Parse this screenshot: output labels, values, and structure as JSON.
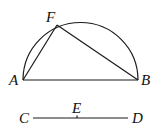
{
  "diagram": {
    "points": {
      "A": {
        "label": "A",
        "x": 23,
        "y": 80
      },
      "B": {
        "label": "B",
        "x": 138,
        "y": 80
      },
      "F": {
        "label": "F",
        "x": 57,
        "y": 25
      },
      "C": {
        "label": "C",
        "x": 33,
        "y": 118
      },
      "D": {
        "label": "D",
        "x": 128,
        "y": 118
      },
      "E": {
        "label": "E",
        "x": 77,
        "y": 118
      }
    },
    "semicircle": {
      "center_x": 80.5,
      "center_y": 80,
      "radius": 57.5
    },
    "segments": [
      "AB",
      "AF",
      "FB",
      "CD"
    ],
    "colors": {
      "stroke": "#1a1a1a",
      "background": "#ffffff"
    }
  }
}
